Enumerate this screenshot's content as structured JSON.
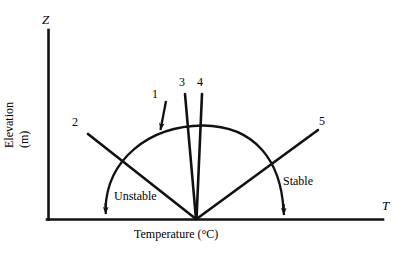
{
  "figure": {
    "type": "diagram",
    "background_color": "#ffffff",
    "stroke_color": "#000000",
    "width": 411,
    "height": 254
  },
  "axes": {
    "y_axis_letter": "Z",
    "y_axis_title": "Elevation (m)",
    "x_axis_letter": "T",
    "x_axis_title": "Temperature (°C)",
    "origin_px": [
      48,
      219
    ],
    "corner_px": [
      48,
      219
    ],
    "y_axis_top_px": [
      48,
      30
    ],
    "x_axis_right_px": [
      383,
      219
    ]
  },
  "fan_origin_px": [
    196,
    219
  ],
  "curves": [
    {
      "id": "1",
      "label": "1",
      "label_px": [
        155,
        90
      ],
      "kind": "arrow-to-arc",
      "start_px": [
        165,
        102
      ],
      "end_px": [
        158,
        131
      ],
      "arrowhead": "end",
      "description": "short arrow pointing down-left onto the semicircular arc"
    },
    {
      "id": "2",
      "label": "2",
      "label_px": [
        74,
        118
      ],
      "kind": "ray",
      "start_px": [
        88,
        134
      ],
      "end_px": [
        196,
        219
      ],
      "arrowhead": "none",
      "description": "line from upper-left descending to the fan origin"
    },
    {
      "id": "3",
      "label": "3",
      "label_px": [
        181,
        78
      ],
      "kind": "ray",
      "start_px": [
        185,
        94
      ],
      "end_px": [
        196,
        219
      ],
      "arrowhead": "none",
      "description": "near-vertical line slightly tilted left of vertical"
    },
    {
      "id": "4",
      "label": "4",
      "label_px": [
        199,
        78
      ],
      "kind": "ray",
      "start_px": [
        202,
        94
      ],
      "end_px": [
        196,
        219
      ],
      "arrowhead": "none",
      "description": "near-vertical line slightly tilted right of vertical"
    },
    {
      "id": "5",
      "label": "5",
      "label_px": [
        321,
        117
      ],
      "kind": "ray",
      "start_px": [
        318,
        130
      ],
      "end_px": [
        196,
        219
      ],
      "arrowhead": "none",
      "description": "line from upper-right descending to the fan origin"
    }
  ],
  "arc": {
    "name": "semicircular-sweep-arc",
    "left_end_px": [
      105,
      216
    ],
    "right_end_px": [
      284,
      217
    ],
    "apex_px": [
      203,
      125
    ],
    "arrowheads": [
      "left-end-down",
      "right-end-down"
    ],
    "description": "semicircular arc spanning the fan, arrowheads pointing down at both ends toward the temperature axis"
  },
  "regions": [
    {
      "label": "Unstable",
      "label_px": [
        118,
        189
      ],
      "side": "left"
    },
    {
      "label": "Stable",
      "label_px": [
        285,
        175
      ],
      "side": "right"
    }
  ]
}
